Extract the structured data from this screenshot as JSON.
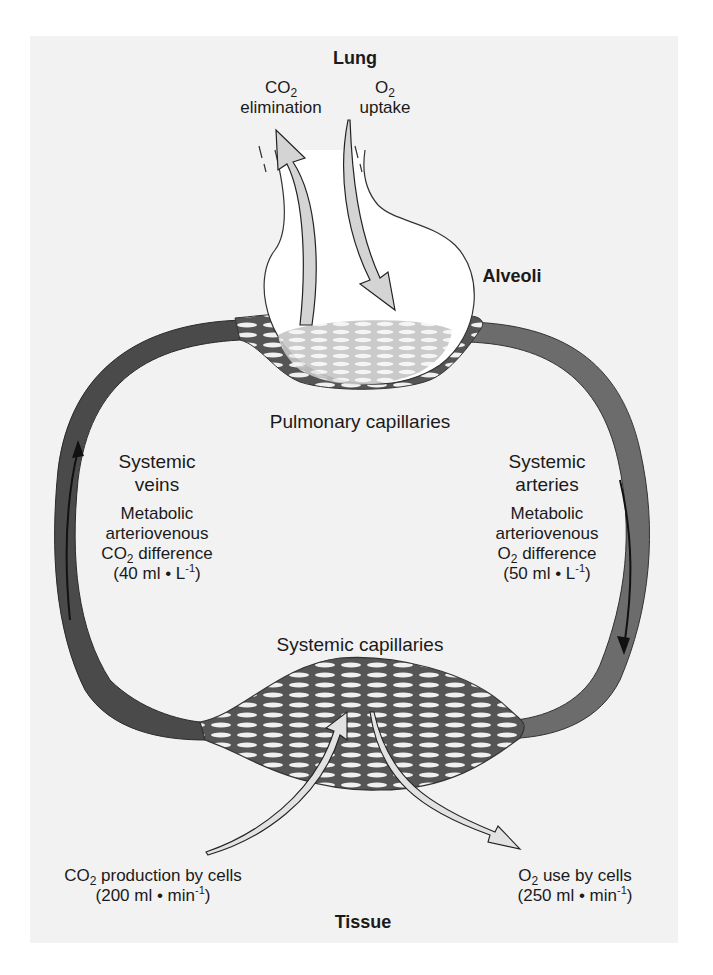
{
  "title": "Lung",
  "lung": {
    "co2_label": "CO",
    "co2_sub": "2",
    "co2_text": "elimination",
    "o2_label": "O",
    "o2_sub": "2",
    "o2_text": "uptake"
  },
  "alveoli_label": "Alveoli",
  "pulmonary_label": "Pulmonary capillaries",
  "veins": {
    "title_line1": "Systemic",
    "title_line2": "veins",
    "line1": "Metabolic",
    "line2": "arteriovenous",
    "gas": "CO",
    "gas_sub": "2",
    "diff": " difference",
    "value_open": "(40 ml • L",
    "value_sup": "-1",
    "value_close": ")"
  },
  "arteries": {
    "title_line1": "Systemic",
    "title_line2": "arteries",
    "line1": "Metabolic",
    "line2": "arteriovenous",
    "gas": "O",
    "gas_sub": "2",
    "diff": " difference",
    "value_open": "(50 ml • L",
    "value_sup": "-1",
    "value_close": ")"
  },
  "systemic_capillaries_label": "Systemic capillaries",
  "co2_production": {
    "gas": "CO",
    "gas_sub": "2",
    "text": " production by cells",
    "value_open": "(200 ml • min",
    "value_sup": "-1",
    "value_close": ")"
  },
  "o2_use": {
    "gas": "O",
    "gas_sub": "2",
    "text": " use by cells",
    "value_open": "(250 ml • min",
    "value_sup": "-1",
    "value_close": ")"
  },
  "tissue_label": "Tissue",
  "colors": {
    "panel_bg": "#f2f2f2",
    "vein_vessel": "#4a4a4a",
    "artery_vessel": "#6c6c6c",
    "arrow_fill": "#d4d4d4",
    "alveolus_fill": "#ffffff"
  }
}
